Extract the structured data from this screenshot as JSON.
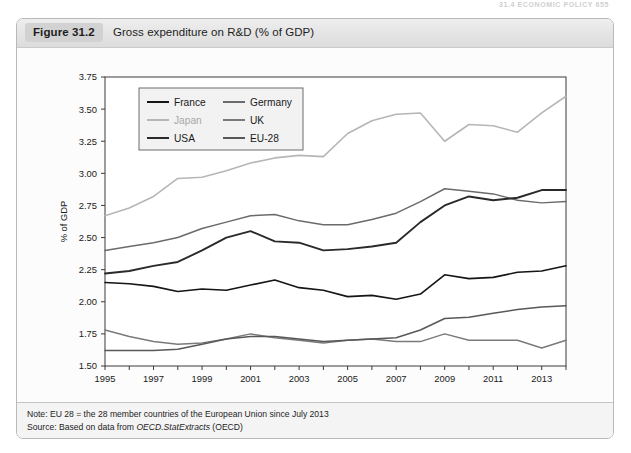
{
  "running_header": "31.4  ECONOMIC POLICY  655",
  "figure": {
    "number": "Figure 31.2",
    "title": "Gross expenditure on R&D (% of GDP)"
  },
  "footer": {
    "note_label": "Note:",
    "note_text": " EU 28 = the 28 member countries of the European Union since July 2013",
    "source_label": "Source:",
    "source_text_pre": " Based on data from ",
    "source_em": "OECD.StatExtracts",
    "source_text_post": " (OECD)"
  },
  "chart_data": {
    "type": "line",
    "title": "Gross expenditure on R&D (% of GDP)",
    "xlabel": "",
    "ylabel": "% of GDP",
    "ylim": [
      1.5,
      3.75
    ],
    "ytick_step": 0.25,
    "ytick_labels": [
      "1.50",
      "1.75",
      "2.00",
      "2.25",
      "2.50",
      "2.75",
      "3.00",
      "3.25",
      "3.50",
      "3.75"
    ],
    "xlim": [
      1995,
      2014
    ],
    "x": [
      1995,
      1996,
      1997,
      1998,
      1999,
      2000,
      2001,
      2002,
      2003,
      2004,
      2005,
      2006,
      2007,
      2008,
      2009,
      2010,
      2011,
      2012,
      2013,
      2014
    ],
    "xtick_labels": [
      "1995",
      "1997",
      "1999",
      "2001",
      "2003",
      "2005",
      "2007",
      "2009",
      "2011",
      "2013"
    ],
    "xtick_years": [
      1995,
      1997,
      1999,
      2001,
      2003,
      2005,
      2007,
      2009,
      2011,
      2013
    ],
    "grid": false,
    "legend_position": "top-left",
    "series": [
      {
        "name": "France",
        "color": "#151515",
        "width": 1.6,
        "values": [
          2.15,
          2.14,
          2.12,
          2.08,
          2.1,
          2.09,
          2.13,
          2.17,
          2.11,
          2.09,
          2.04,
          2.05,
          2.02,
          2.06,
          2.21,
          2.18,
          2.19,
          2.23,
          2.24,
          2.28
        ]
      },
      {
        "name": "Germany",
        "color": "#6b6b6b",
        "width": 1.5,
        "values": [
          2.4,
          2.43,
          2.46,
          2.5,
          2.57,
          2.62,
          2.67,
          2.68,
          2.63,
          2.6,
          2.6,
          2.64,
          2.69,
          2.78,
          2.88,
          2.86,
          2.84,
          2.79,
          2.77,
          2.78
        ]
      },
      {
        "name": "Japan",
        "color": "#b6b6b6",
        "width": 1.6,
        "values": [
          2.67,
          2.73,
          2.82,
          2.96,
          2.97,
          3.02,
          3.08,
          3.12,
          3.14,
          3.13,
          3.31,
          3.41,
          3.46,
          3.47,
          3.25,
          3.38,
          3.37,
          3.32,
          3.47,
          3.6
        ]
      },
      {
        "name": "UK",
        "color": "#7a7a7a",
        "width": 1.5,
        "values": [
          1.78,
          1.73,
          1.69,
          1.67,
          1.68,
          1.71,
          1.75,
          1.72,
          1.7,
          1.68,
          1.7,
          1.71,
          1.69,
          1.69,
          1.75,
          1.7,
          1.7,
          1.7,
          1.64,
          1.7
        ]
      },
      {
        "name": "USA",
        "color": "#2a2a2a",
        "width": 1.9,
        "values": [
          2.22,
          2.24,
          2.28,
          2.31,
          2.4,
          2.5,
          2.55,
          2.47,
          2.46,
          2.4,
          2.41,
          2.43,
          2.46,
          2.62,
          2.75,
          2.82,
          2.79,
          2.81,
          2.87,
          2.87
        ]
      },
      {
        "name": "EU-28",
        "color": "#585858",
        "width": 1.5,
        "values": [
          1.62,
          1.62,
          1.62,
          1.63,
          1.67,
          1.71,
          1.73,
          1.73,
          1.71,
          1.69,
          1.7,
          1.71,
          1.72,
          1.78,
          1.87,
          1.88,
          1.91,
          1.94,
          1.96,
          1.97
        ]
      }
    ],
    "legend_entries": [
      {
        "label": "France",
        "color": "#151515",
        "col": 0,
        "row": 0
      },
      {
        "label": "Germany",
        "color": "#6b6b6b",
        "col": 1,
        "row": 0
      },
      {
        "label": "Japan",
        "color": "#b6b6b6",
        "col": 0,
        "row": 1
      },
      {
        "label": "UK",
        "color": "#7a7a7a",
        "col": 1,
        "row": 1
      },
      {
        "label": "USA",
        "color": "#2a2a2a",
        "col": 0,
        "row": 2
      },
      {
        "label": "EU-28",
        "color": "#585858",
        "col": 1,
        "row": 2
      }
    ]
  }
}
